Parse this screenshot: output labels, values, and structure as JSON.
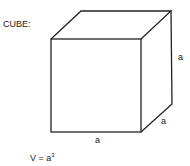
{
  "diagram": {
    "title": "CUBE:",
    "labels": {
      "right_edge": "a",
      "depth_edge": "a",
      "bottom_edge": "a"
    },
    "formula": {
      "lhs": "V = a",
      "exponent": "3"
    },
    "stroke_color": "#222222"
  }
}
